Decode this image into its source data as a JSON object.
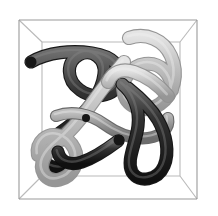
{
  "figure": {
    "kind": "3d-polymer-chain-rendering",
    "title": "",
    "background_color": "#ffffff",
    "width": 218,
    "height": 216
  },
  "bounding_box": {
    "name": "perspective-wireframe-cube",
    "edge_color": "#b9b9b9",
    "edge_color_dark": "#9a9a9a",
    "edge_width": 1.1,
    "front_face": {
      "x0": 19,
      "y0": 20,
      "x1": 197,
      "y1": 199
    },
    "back_face": {
      "x0": 42,
      "y0": 42,
      "x1": 180,
      "y1": 176
    }
  },
  "palette": {
    "tube_dark": "#2b2b2b",
    "tube_dark_shade": "#121212",
    "tube_dark_highlight": "#6e6e6e",
    "tube_mid": "#8d8d8d",
    "tube_light": "#bdbdbd",
    "tube_light_shade": "#9c9c9c",
    "tube_light_highlight": "#e2e2e2"
  },
  "chains": [
    {
      "id": "chain-dark-1",
      "shade": "dark",
      "width": 11,
      "cap": "round",
      "path": "M 31 62 C 48 52, 72 50, 92 53 C 112 56, 124 66, 119 82 C 114 98, 92 99, 80 90 C 66 80, 66 62, 79 55 C 92 48, 106 59, 104 74 C 102 92, 88 110, 74 122 C 60 134, 46 140, 44 152 C 42 166, 56 172, 70 166"
    },
    {
      "id": "chain-light-1",
      "shade": "light",
      "width": 12,
      "cap": "round",
      "path": "M 129 38 C 146 32, 164 40, 171 56 C 179 74, 174 94, 160 104 C 146 114, 128 108, 124 94 C 120 80, 131 66, 145 64 C 160 62, 172 74, 172 90"
    },
    {
      "id": "chain-light-2",
      "shade": "light",
      "width": 12,
      "cap": "round",
      "path": "M 124 62 C 112 76, 100 92, 90 106 C 80 120, 70 132, 58 142 C 46 152, 38 164, 44 174 C 51 185, 68 180, 74 168 C 81 154, 72 140, 60 136 C 47 132, 36 142, 38 155"
    },
    {
      "id": "chain-mid-1",
      "shade": "mid",
      "width": 10,
      "cap": "round",
      "path": "M 56 116 C 72 110, 90 114, 104 124 C 118 134, 132 140, 148 138 C 162 136, 170 128, 168 118"
    },
    {
      "id": "chain-dark-2",
      "shade": "dark",
      "width": 11,
      "cap": "round",
      "path": "M 122 84 C 134 94, 140 110, 138 126 C 136 144, 126 160, 132 172 C 139 184, 158 180, 164 166 C 170 152, 166 134, 158 120 C 150 106, 138 96, 128 88"
    },
    {
      "id": "chain-dark-3",
      "shade": "dark",
      "width": 11,
      "cap": "round",
      "path": "M 118 141 C 106 150, 94 158, 82 162 C 70 166, 60 162, 58 152"
    },
    {
      "id": "chain-light-3",
      "shade": "light",
      "width": 12,
      "cap": "round",
      "path": "M 168 96 C 158 84, 146 76, 134 72 C 122 68, 112 72, 108 82"
    }
  ],
  "endpoints": [
    {
      "id": "endpoint-dark-left",
      "x": 31,
      "y": 62,
      "r": 5.5,
      "shade": "dark"
    },
    {
      "id": "endpoint-dark-center",
      "x": 119,
      "y": 140,
      "r": 5.5,
      "shade": "dark"
    },
    {
      "id": "endpoint-dark-small",
      "x": 86,
      "y": 118,
      "r": 4.0,
      "shade": "dark"
    }
  ]
}
